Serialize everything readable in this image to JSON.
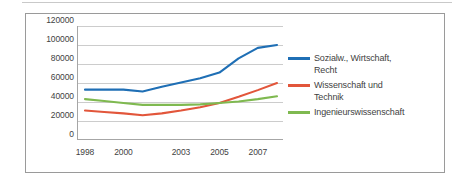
{
  "chart_data": {
    "type": "line",
    "title": "",
    "subtitle": "",
    "xlabel": "",
    "ylabel": "",
    "grid": true,
    "legend_position": "right",
    "xlim": [
      1998,
      2008
    ],
    "ylim": [
      0,
      120000
    ],
    "y_ticks": [
      0,
      20000,
      40000,
      60000,
      80000,
      100000,
      120000
    ],
    "y_tick_labels": [
      "0",
      "20000",
      "40000",
      "60000",
      "80000",
      "100000",
      "120000"
    ],
    "x": [
      1998,
      1999,
      2000,
      2001,
      2002,
      2003,
      2004,
      2005,
      2006,
      2007,
      2008
    ],
    "x_tick_labels": [
      "1998",
      "2000",
      "2003",
      "2005",
      "2007"
    ],
    "x_tick_values": [
      1998,
      2000,
      2003,
      2005,
      2007
    ],
    "series": [
      {
        "name": "Sozialw., Wirtschaft, Recht",
        "color": "#1F6FB5",
        "values": [
          53000,
          53000,
          53000,
          51000,
          56000,
          60500,
          65000,
          71000,
          86000,
          97000,
          100000
        ]
      },
      {
        "name": "Wissenschaft und Technik",
        "color": "#E2563B",
        "values": [
          31000,
          29500,
          28000,
          26000,
          28000,
          31000,
          34500,
          39000,
          45500,
          52500,
          60000
        ]
      },
      {
        "name": "Ingenieurswissenschaft",
        "color": "#7FB950",
        "values": [
          43000,
          41000,
          39000,
          37000,
          37000,
          37000,
          37500,
          39000,
          40500,
          43000,
          46000
        ]
      }
    ]
  },
  "legend": {
    "items": [
      {
        "label": "Sozialw., Wirtschaft,\nRecht",
        "color": "#1F6FB5",
        "name": "legend-item-sozialwissenschaft"
      },
      {
        "label": "Wissenschaft und\nTechnik",
        "color": "#E2563B",
        "name": "legend-item-wissenschaft-technik"
      },
      {
        "label": "Ingenieurswissenschaft",
        "color": "#7FB950",
        "name": "legend-item-ingenieurswissenschaft"
      }
    ]
  },
  "colors": {
    "frame_border": "#9A9A9A",
    "gridline": "#BFBFBF",
    "axis": "#A6A6A6",
    "tick_text": "#3F3F3F",
    "page_rule": "#C9C9C9"
  }
}
